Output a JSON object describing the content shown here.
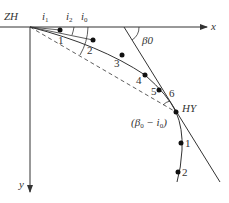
{
  "diagram": {
    "type": "spiral-curve deflection angle layout",
    "axes": {
      "x_label": "x",
      "y_label": "y"
    },
    "points": {
      "start": "ZH",
      "end": "HY",
      "angle_labels": [
        "i1",
        "i2",
        "i0"
      ],
      "beta0": "β0",
      "beta_minus_i": "(β0 − i0)"
    },
    "spiral_points": [
      "1",
      "2",
      "3",
      "4",
      "5",
      "6"
    ],
    "circular_points": [
      "1",
      "2"
    ],
    "caption": ""
  }
}
